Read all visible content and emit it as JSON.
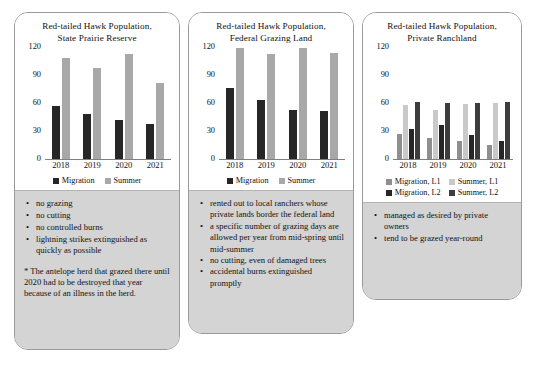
{
  "colors": {
    "dark": "#262626",
    "light_gray": "#a8a8a8",
    "medium_gray": "#8f8f8f",
    "pale_gray": "#c9c9c9",
    "note_bg": "#d4d4d4",
    "axis": "#808080"
  },
  "panels": [
    {
      "title_line1": "Red-tailed Hawk Population,",
      "title_line2": "State Prairie Reserve",
      "notes": {
        "bullets": [
          "no grazing",
          "no cutting",
          "no controlled burns",
          "lightning strikes extinguished as quickly as possible"
        ],
        "footnote": "* The antelope herd that grazed there until 2020 had to be destroyed that year because of an illness in the herd."
      }
    },
    {
      "title_line1": "Red-tailed Hawk Population,",
      "title_line2": "Federal Grazing Land",
      "notes": {
        "bullets": [
          "rented out to local ranchers whose private lands border the federal land",
          "a specific number of grazing days are allowed per year from mid-spring until mid-summer",
          "no cutting, even of damaged trees",
          "accidental burns extinguished promptly"
        ],
        "footnote": ""
      }
    },
    {
      "title_line1": "Red-tailed Hawk Population,",
      "title_line2": "Private Ranchland",
      "notes": {
        "bullets": [
          "managed as desired by private owners",
          "tend to be grazed year-round"
        ],
        "footnote": ""
      }
    }
  ],
  "chart_data": [
    {
      "type": "bar",
      "title": "Red-tailed Hawk Population, State Prairie Reserve",
      "categories": [
        "2018",
        "2019",
        "2020",
        "2021"
      ],
      "series": [
        {
          "name": "Migration",
          "values": [
            57,
            48,
            42,
            37
          ],
          "color": "#262626"
        },
        {
          "name": "Summer",
          "values": [
            108,
            97,
            112,
            81
          ],
          "color": "#a8a8a8"
        }
      ],
      "xlabel": "",
      "ylabel": "",
      "ylim": [
        0,
        120
      ],
      "yticks": [
        0,
        30,
        60,
        90,
        120
      ],
      "grid": false,
      "legend_position": "bottom"
    },
    {
      "type": "bar",
      "title": "Red-tailed Hawk Population, Federal Grazing Land",
      "categories": [
        "2018",
        "2019",
        "2020",
        "2021"
      ],
      "series": [
        {
          "name": "Migration",
          "values": [
            76,
            63,
            53,
            51
          ],
          "color": "#262626"
        },
        {
          "name": "Summer",
          "values": [
            119,
            112,
            119,
            114
          ],
          "color": "#a8a8a8"
        }
      ],
      "xlabel": "",
      "ylabel": "",
      "ylim": [
        0,
        120
      ],
      "yticks": [
        0,
        30,
        60,
        90,
        120
      ],
      "grid": false,
      "legend_position": "bottom"
    },
    {
      "type": "bar",
      "title": "Red-tailed Hawk Population, Private Ranchland",
      "categories": [
        "2018",
        "2019",
        "2020",
        "2021"
      ],
      "series": [
        {
          "name": "Migration, L1",
          "values": [
            27,
            22,
            19,
            15
          ],
          "color": "#8f8f8f"
        },
        {
          "name": "Summer, L1",
          "values": [
            58,
            53,
            59,
            60
          ],
          "color": "#c9c9c9"
        },
        {
          "name": "Migration, L2",
          "values": [
            32,
            36,
            26,
            19
          ],
          "color": "#262626"
        },
        {
          "name": "Summer, L2",
          "values": [
            61,
            60,
            60,
            61
          ],
          "color": "#3d3d3d"
        }
      ],
      "xlabel": "",
      "ylabel": "",
      "ylim": [
        0,
        120
      ],
      "yticks": [
        0,
        30,
        60,
        90,
        120
      ],
      "grid": false,
      "legend_position": "bottom"
    }
  ]
}
